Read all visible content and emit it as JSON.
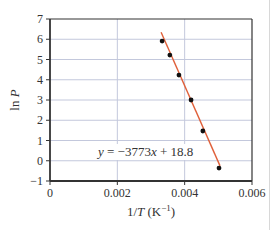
{
  "chart_data": {
    "type": "scatter",
    "title": "",
    "xlabel": "1/T (K⁻¹)",
    "ylabel": "ln P",
    "xlim": [
      0,
      0.006
    ],
    "ylim": [
      -1,
      7
    ],
    "x_ticks": [
      0,
      0.002,
      0.004,
      0.006
    ],
    "x_tick_labels": [
      "0",
      "0.002",
      "0.004",
      "0.006"
    ],
    "y_ticks": [
      -1,
      0,
      1,
      2,
      3,
      4,
      5,
      6,
      7
    ],
    "y_tick_labels": [
      "−1",
      "0",
      "1",
      "2",
      "3",
      "4",
      "5",
      "6",
      "7"
    ],
    "grid": true,
    "series": [
      {
        "name": "data",
        "kind": "points",
        "x": [
          0.00333,
          0.00356,
          0.00383,
          0.00419,
          0.00454,
          0.00502
        ],
        "y": [
          5.91,
          5.22,
          4.23,
          3.0,
          1.47,
          -0.36
        ]
      },
      {
        "name": "fit",
        "kind": "line",
        "slope": -3773,
        "intercept": 18.8,
        "x_range": [
          0.0033,
          0.00505
        ]
      }
    ],
    "annotations": [
      {
        "text": "y = −3773x + 18.8",
        "x": 0.003,
        "y": 0.5
      }
    ]
  },
  "labels": {
    "ylabel_main": "ln ",
    "ylabel_var": "P",
    "xlabel_prefix": "1/",
    "xlabel_var": "T",
    "xlabel_unit": " (K",
    "xlabel_sup": "−1",
    "xlabel_close": ")",
    "equation_y": "y",
    "equation_mid": " = −3773",
    "equation_x": "x",
    "equation_rest": " + 18.8"
  },
  "colors": {
    "axis": "#333333",
    "grid": "#c3c8dc",
    "fit_line": "#e0603a",
    "points": "#111111"
  }
}
